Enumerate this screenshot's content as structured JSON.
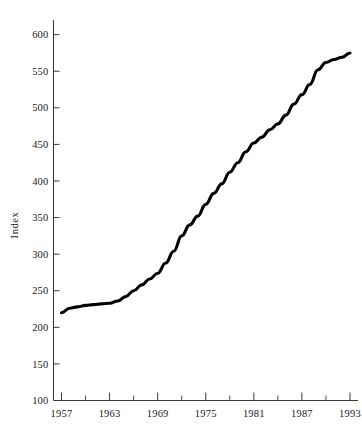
{
  "chart_data": {
    "type": "line",
    "title": "",
    "xlabel": "",
    "ylabel": "Index",
    "xlim": [
      1956,
      1994
    ],
    "ylim": [
      100,
      620
    ],
    "grid": false,
    "legend": null,
    "x_tick_labels": [
      "1957",
      "1963",
      "1969",
      "1975",
      "1981",
      "1987",
      "1993"
    ],
    "x_tick_values": [
      1957,
      1963,
      1969,
      1975,
      1981,
      1987,
      1993
    ],
    "x_minor_tick_values": [
      1960,
      1966,
      1972,
      1978,
      1984,
      1990
    ],
    "y_tick_labels": [
      "100",
      "150",
      "200",
      "250",
      "300",
      "350",
      "400",
      "450",
      "500",
      "550",
      "600"
    ],
    "y_tick_values": [
      100,
      150,
      200,
      250,
      300,
      350,
      400,
      450,
      500,
      550,
      600
    ],
    "series": [
      {
        "name": "Index",
        "color": "#000000",
        "x": [
          1957,
          1958,
          1959,
          1960,
          1961,
          1962,
          1963,
          1964,
          1965,
          1966,
          1967,
          1968,
          1969,
          1970,
          1971,
          1972,
          1973,
          1974,
          1975,
          1976,
          1977,
          1978,
          1979,
          1980,
          1981,
          1982,
          1983,
          1984,
          1985,
          1986,
          1987,
          1988,
          1989,
          1990,
          1991,
          1992,
          1993
        ],
        "values": [
          220,
          226,
          228,
          230,
          231,
          232,
          233,
          236,
          242,
          250,
          258,
          266,
          274,
          288,
          304,
          325,
          340,
          352,
          368,
          383,
          396,
          412,
          425,
          440,
          452,
          460,
          470,
          478,
          490,
          505,
          518,
          532,
          552,
          562,
          566,
          569,
          575
        ]
      }
    ]
  },
  "axes": {
    "y_axis_name": "y-axis",
    "x_axis_name": "x-axis"
  }
}
